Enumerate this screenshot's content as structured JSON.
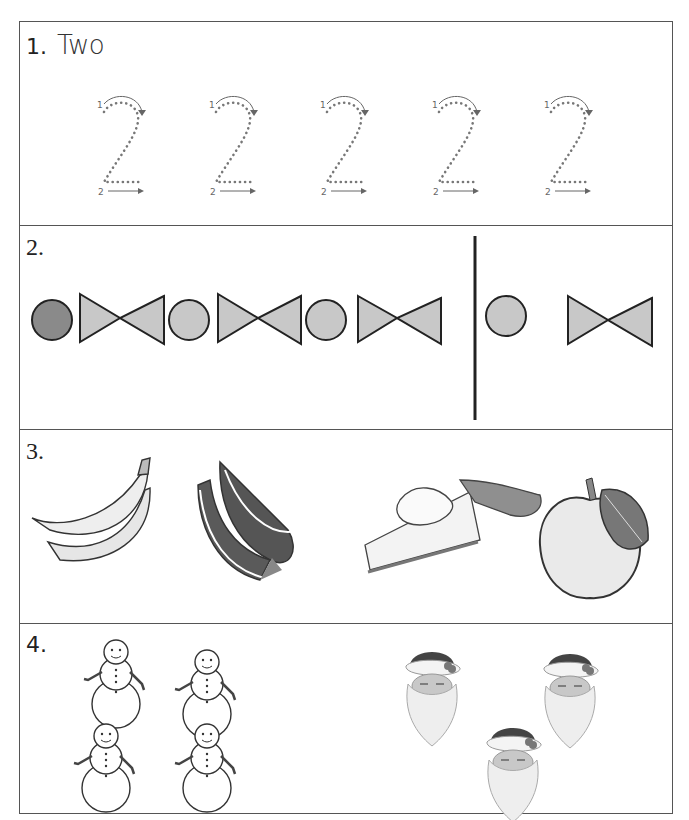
{
  "worksheet": {
    "sections": [
      {
        "number": "1.",
        "title": "Two",
        "trace_digit": "2",
        "trace_count": 5,
        "stroke_labels": [
          "1",
          "2"
        ]
      },
      {
        "number": "2.",
        "pattern": [
          "circle-dark",
          "bowtie",
          "circle",
          "bowtie",
          "circle",
          "bowtie"
        ],
        "answer_choices": [
          "circle",
          "bowtie"
        ],
        "colors": {
          "fill_light": "#c8c8c8",
          "fill_dark": "#8a8a8a",
          "stroke": "#222222"
        }
      },
      {
        "number": "3.",
        "pictures": [
          "banana",
          "watermelon",
          "pie",
          "apple"
        ]
      },
      {
        "number": "4.",
        "groups": [
          {
            "item": "snowman",
            "count": 4
          },
          {
            "item": "santa",
            "count": 3
          }
        ]
      }
    ]
  }
}
